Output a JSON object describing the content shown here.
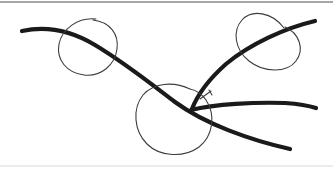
{
  "canvas": {
    "width": 333,
    "height": 169,
    "background_color": "#ffffff",
    "title": "Hand-drawn sketch annotation"
  },
  "colors": {
    "thick_ink": "#1a1a1a",
    "thin_ink": "#3c3c3c",
    "top_border": "#8a8a8a",
    "bottom_border": "#d8d8d8",
    "background": "#ffffff"
  },
  "frame": {
    "top_border": {
      "label": "top-border-line",
      "y": 2,
      "x_start": 0,
      "x_end": 333,
      "thickness": 1.4,
      "color": "#8a8a8a"
    },
    "bottom_border": {
      "label": "bottom-border-line",
      "y": 166,
      "x_start": 0,
      "x_end": 333,
      "thickness": 1,
      "color": "#d8d8d8"
    }
  },
  "strokes": {
    "thick_width": 4.2,
    "thin_width": 1.1,
    "items": [
      {
        "name": "main-descending-curve",
        "type": "thick",
        "description": "Long curve entering from left edge, arcing over the left circle then descending diagonally to lower right",
        "path": "M 22 31 C 45 26, 70 30, 95 45 C 125 63, 150 83, 175 102 C 205 124, 250 140, 290 149"
      },
      {
        "name": "upper-right-ascending-stroke",
        "type": "thick",
        "description": "Stroke rising from the V vertex up through the top-right circle to the right edge",
        "path": "M 192 109 C 197 96, 208 80, 226 64 C 250 44, 285 28, 315 21"
      },
      {
        "name": "horizontal-right-stroke",
        "type": "thick",
        "description": "Near-horizontal stroke leaving the V vertex toward the right edge",
        "path": "M 191 110 C 215 104, 255 102, 285 103 C 300 104, 310 106, 316 108"
      },
      {
        "name": "left-circle",
        "type": "thin",
        "description": "Thin hand-drawn oval on the left, with a small gap at the top",
        "path": "M 96 19 C 78 17, 62 29, 59 44 C 56 60, 67 73, 84 75 C 101 77, 115 65, 117 49 C 119 34, 110 22, 93 20"
      },
      {
        "name": "center-circle",
        "type": "thin",
        "description": "Thin hand-drawn oval in the center, overlapping the main curve and vertex",
        "path": "M 190 89 C 173 81, 153 83, 143 95 C 132 109, 134 131, 147 144 C 160 157, 184 158, 199 147 C 213 136, 216 115, 206 100 C 201 93, 195 90, 190 89"
      },
      {
        "name": "top-right-circle",
        "type": "thin",
        "description": "Thin tilted hand-drawn oval in the top right, crossed by the ascending stroke",
        "path": "M 284 28 C 272 12, 252 9, 242 20 C 232 31, 235 50, 249 61 C 264 73, 287 73, 296 61 C 305 49, 299 33, 285 27"
      },
      {
        "name": "vertex-tick-mark",
        "type": "thin",
        "description": "Small thin tick near the V vertex resembling an arrowhead flick",
        "path": "M 200 99 L 211 91 M 209 90 L 212 95"
      }
    ]
  }
}
